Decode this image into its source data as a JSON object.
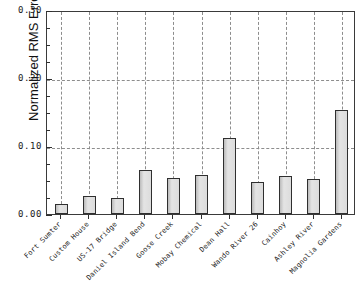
{
  "chart_data": {
    "type": "bar",
    "title": "",
    "xlabel": "",
    "ylabel": "Normalized RMS Error",
    "ylim": [
      0.0,
      0.3
    ],
    "ytick_labels": [
      "0.00",
      "0.10",
      "0.20",
      "0.30"
    ],
    "ytick_values": [
      0.0,
      0.1,
      0.2,
      0.3
    ],
    "yminor_step": 0.025,
    "grid": "both-dotted",
    "legend": "none",
    "categories": [
      "Fort Sumter",
      "Custom House",
      "US-17 Bridge",
      "Daniel Island Bend",
      "Goose Creek",
      "Mobay Chemical",
      "Dean Hall",
      "Wando River 26",
      "Cainhoy",
      "Ashley River",
      "Magnolia Gardens"
    ],
    "values": [
      0.014,
      0.026,
      0.023,
      0.065,
      0.053,
      0.057,
      0.112,
      0.047,
      0.056,
      0.052,
      0.153
    ],
    "bar_color": "#d9d9d9",
    "bar_edge_color": "#2f2f2f",
    "grid_color": "#8d8d8d",
    "axis_color": "#3a3a3a"
  }
}
